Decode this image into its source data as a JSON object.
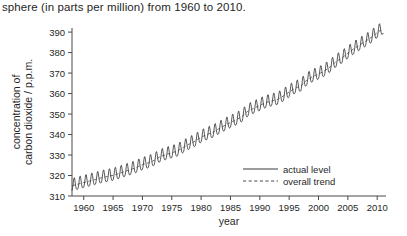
{
  "caption": "sphere (in parts per million) from 1960 to 2010.",
  "chart_data": {
    "type": "line",
    "title": "",
    "xlabel": "year",
    "ylabel_line1": "concentration of",
    "ylabel_line2": "carbon dioxide / p.p.m.",
    "xlim": [
      1958,
      2011.5
    ],
    "ylim": [
      310,
      392
    ],
    "xticks": [
      1960,
      1965,
      1970,
      1975,
      1980,
      1985,
      1990,
      1995,
      2000,
      2005,
      2010
    ],
    "xtick_labels": [
      "1960",
      "1965",
      "1970",
      "1975",
      "1980",
      "1985",
      "1990",
      "1995",
      "2000",
      "2005",
      "2010"
    ],
    "yticks": [
      310,
      320,
      330,
      340,
      350,
      360,
      370,
      380,
      390
    ],
    "ytick_labels": [
      "310",
      "320",
      "330",
      "340",
      "350",
      "360",
      "370",
      "380",
      "390"
    ],
    "grid": false,
    "legend_position": "bottom-right-inside",
    "legend": [
      {
        "name": "actual level",
        "style": "solid"
      },
      {
        "name": "overall trend",
        "style": "dashed"
      }
    ],
    "line_color": "#3a3a3a",
    "trend_color": "#4d4d4d",
    "seasonal_amplitude_ppm": 3.1,
    "series": [
      {
        "name": "overall trend",
        "style": "dashed",
        "x": [
          1958,
          1959,
          1960,
          1961,
          1962,
          1963,
          1964,
          1965,
          1966,
          1967,
          1968,
          1969,
          1970,
          1971,
          1972,
          1973,
          1974,
          1975,
          1976,
          1977,
          1978,
          1979,
          1980,
          1981,
          1982,
          1983,
          1984,
          1985,
          1986,
          1987,
          1988,
          1989,
          1990,
          1991,
          1992,
          1993,
          1994,
          1995,
          1996,
          1997,
          1998,
          1999,
          2000,
          2001,
          2002,
          2003,
          2004,
          2005,
          2006,
          2007,
          2008,
          2009,
          2010,
          2011
        ],
        "values": [
          315.0,
          315.8,
          316.6,
          317.3,
          318.1,
          318.9,
          319.5,
          320.1,
          321.0,
          322.0,
          322.9,
          324.0,
          325.3,
          326.2,
          327.4,
          329.2,
          330.2,
          331.1,
          332.0,
          333.8,
          335.4,
          336.8,
          338.7,
          340.0,
          341.1,
          342.8,
          344.4,
          345.9,
          347.2,
          348.9,
          351.5,
          352.9,
          354.2,
          355.6,
          356.4,
          357.1,
          358.8,
          360.8,
          362.6,
          363.7,
          366.6,
          368.3,
          369.5,
          371.0,
          373.1,
          375.6,
          377.4,
          379.7,
          381.8,
          383.7,
          385.5,
          387.4,
          389.8,
          391.6
        ]
      },
      {
        "name": "actual level",
        "style": "solid",
        "description": "monthly Keeling curve values: overall trend plus annual seasonal oscillation peaking in May and troughing in October",
        "x_start": 1958,
        "x_end": 2011,
        "points_per_year": 12
      }
    ]
  }
}
